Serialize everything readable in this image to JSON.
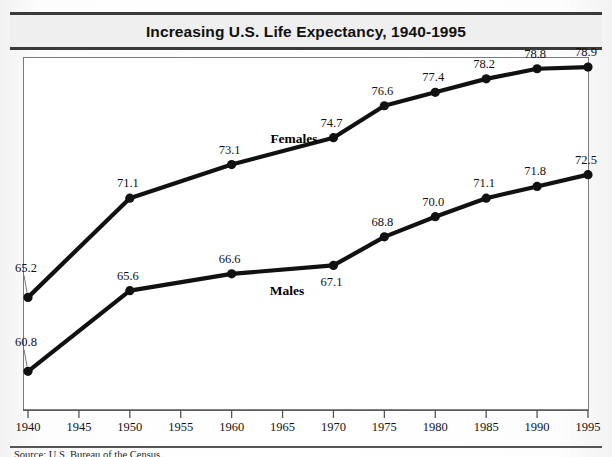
{
  "title": "Increasing U.S. Life Expectancy, 1940-1995",
  "source_note": "Source: U.S. Bureau of the Census.",
  "colors": {
    "line": "#111111",
    "marker": "#111111",
    "frame": "#7a7a7a",
    "title_rule": "#3a3a3a",
    "page_background": "#f4f4f4",
    "plot_background": "#ffffff",
    "title_background": "#efefef"
  },
  "chart_data": {
    "type": "line",
    "title": "Increasing U.S. Life Expectancy, 1940-1995",
    "xlabel": "",
    "ylabel": "",
    "grid": false,
    "legend": "inline-series-labels",
    "xlim": [
      1940,
      1995
    ],
    "ylim": [
      58.5,
      79.5
    ],
    "xticks": [
      1940,
      1945,
      1950,
      1955,
      1960,
      1965,
      1970,
      1975,
      1980,
      1985,
      1990,
      1995
    ],
    "xtick_labels": [
      "1940",
      "1945",
      "1950",
      "1955",
      "1960",
      "1965",
      "1970",
      "1975",
      "1980",
      "1985",
      "1990",
      "1995"
    ],
    "x": [
      1940,
      1950,
      1960,
      1970,
      1975,
      1980,
      1985,
      1990,
      1995
    ],
    "series": [
      {
        "name": "Females",
        "values": [
          65.2,
          71.1,
          73.1,
          74.7,
          76.6,
          77.4,
          78.2,
          78.8,
          78.9
        ],
        "labels": [
          "65.2",
          "71.1",
          "73.1",
          "74.7",
          "76.6",
          "77.4",
          "78.2",
          "78.8",
          "78.9"
        ]
      },
      {
        "name": "Males",
        "values": [
          60.8,
          65.6,
          66.6,
          67.1,
          68.8,
          70.0,
          71.1,
          71.8,
          72.5
        ],
        "labels": [
          "60.8",
          "65.6",
          "66.6",
          "67.1",
          "68.8",
          "70.0",
          "71.1",
          "71.8",
          "72.5"
        ]
      }
    ]
  }
}
